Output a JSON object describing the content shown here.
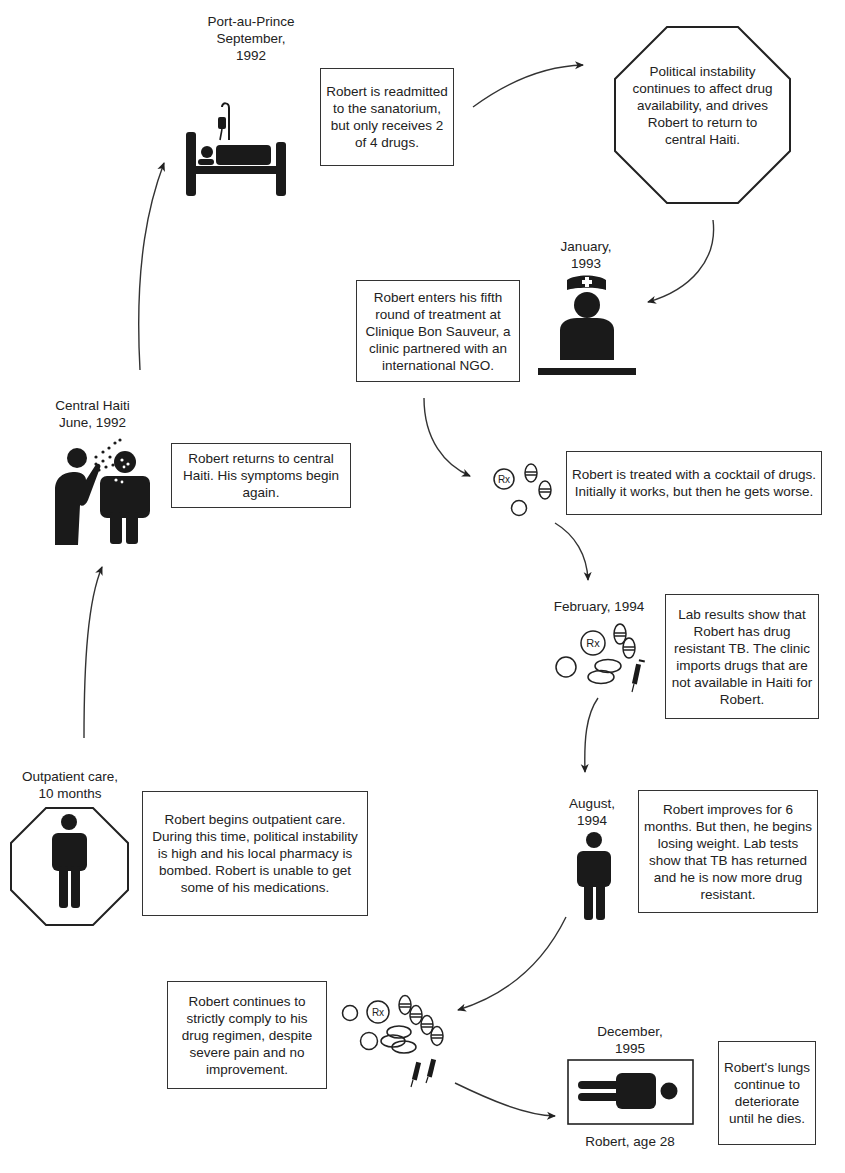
{
  "diagram": {
    "type": "timeline-flow",
    "colors": {
      "ink": "#1e1e1e",
      "background": "#ffffff"
    },
    "stages": [
      {
        "id": "outpatient",
        "label": "Outpatient care,\n10 months",
        "icon": "person-in-octagon-icon",
        "text": "Robert begins outpatient care. During this time, political instability is high and his local pharmacy is bombed. Robert is unable to get some of his medications."
      },
      {
        "id": "central-haiti",
        "label": "Central Haiti\nJune, 1992",
        "icon": "cough-spread-icon",
        "text": "Robert returns to central Haiti. His symptoms begin again."
      },
      {
        "id": "port-au-prince",
        "label": "Port-au-Prince\nSeptember,\n1992",
        "icon": "hospital-bed-icon",
        "text": "Robert is readmitted to the sanatorium, but only receives 2 of 4 drugs."
      },
      {
        "id": "political-instability",
        "label": "",
        "icon": "octagon-stop-shape",
        "text": "Political instability continues to affect drug availability, and drives Robert to return to central Haiti."
      },
      {
        "id": "january-1993",
        "label": "January,\n1993",
        "icon": "nurse-icon",
        "text": "Robert enters his fifth round of treatment at Clinique Bon Sauveur, a clinic partnered with an international NGO."
      },
      {
        "id": "cocktail",
        "label": "",
        "icon": "pills-rx-icon",
        "text": "Robert is treated with a cocktail of drugs. Initially it works, but then he gets worse."
      },
      {
        "id": "february-1994",
        "label": "February, 1994",
        "icon": "pills-syringe-icon",
        "text": "Lab results show that Robert has drug resistant TB. The clinic imports drugs that are not available in Haiti for Robert."
      },
      {
        "id": "august-1994",
        "label": "August,\n1994",
        "icon": "person-icon",
        "text": "Robert improves for 6 months. But then, he begins losing weight. Lab tests show that TB has returned and he is now more drug resistant."
      },
      {
        "id": "regimen",
        "label": "",
        "icon": "many-pills-syringes-icon",
        "text": "Robert continues to strictly comply to his drug regimen, despite severe pain and no improvement."
      },
      {
        "id": "december-1995",
        "label": "December,\n1995",
        "icon": "lying-person-icon",
        "caption": "Robert, age 28",
        "text": "Robert's lungs continue to deteriorate until he dies."
      }
    ],
    "rx_label": "Rx"
  }
}
